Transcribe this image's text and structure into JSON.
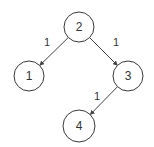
{
  "diagram": {
    "type": "binary-tree",
    "nodes": [
      {
        "id": "n2",
        "label": "2",
        "cx": 79,
        "cy": 27,
        "r": 15
      },
      {
        "id": "n1",
        "label": "1",
        "cx": 29,
        "cy": 76,
        "r": 15
      },
      {
        "id": "n3",
        "label": "3",
        "cx": 128,
        "cy": 76,
        "r": 15
      },
      {
        "id": "n4",
        "label": "4",
        "cx": 79,
        "cy": 126,
        "r": 16
      }
    ],
    "edges": [
      {
        "from": "n2",
        "to": "n1",
        "label": "1",
        "label_x": 47,
        "label_y": 42
      },
      {
        "from": "n2",
        "to": "n3",
        "label": "1",
        "label_x": 116,
        "label_y": 42
      },
      {
        "from": "n3",
        "to": "n4",
        "label": "1",
        "label_x": 97,
        "label_y": 96
      }
    ],
    "colors": {
      "stroke": "#3a3a3a",
      "edge": "#444444",
      "text": "#333333",
      "background": "#ffffff"
    }
  }
}
